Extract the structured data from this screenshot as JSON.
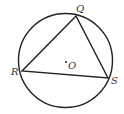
{
  "diagram": {
    "type": "inscribed-triangle-in-circle",
    "circle": {
      "cx": 65.5,
      "cy": 60.5,
      "r": 47,
      "center_label": "O"
    },
    "points": [
      {
        "name": "Q",
        "x": 76,
        "y": 16,
        "label": "Q",
        "lx": 76,
        "ly": 12
      },
      {
        "name": "R",
        "x": 22,
        "y": 71,
        "label": "R",
        "lx": 11,
        "ly": 75
      },
      {
        "name": "S",
        "x": 108,
        "y": 78,
        "label": "S",
        "lx": 112,
        "ly": 83
      }
    ],
    "center_dot": {
      "x": 66,
      "y": 62
    },
    "center_label_pos": {
      "x": 69,
      "y": 69
    },
    "stroke_color": "#222222",
    "label_color": "#333333"
  }
}
